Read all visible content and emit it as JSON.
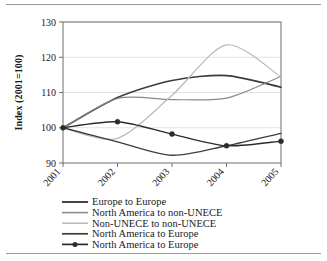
{
  "chart_data": {
    "type": "line",
    "title": "",
    "xlabel": "",
    "ylabel": "Index (2001=100)",
    "x": [
      "2001",
      "2002",
      "2003",
      "2004",
      "2005"
    ],
    "categories": [
      "2001",
      "2002",
      "2003",
      "2004",
      "2005"
    ],
    "ylim": [
      90,
      130
    ],
    "yticks": [
      90,
      100,
      110,
      120,
      130
    ],
    "grid": true,
    "legend_position": "bottom",
    "series": [
      {
        "name": "Europe to Europe",
        "color": "#3d3d3d",
        "marker": "none",
        "width": 1.6,
        "values": [
          100,
          108.6,
          113.4,
          114.8,
          111.5
        ]
      },
      {
        "name": "North America to non-UNECE",
        "color": "#888888",
        "marker": "none",
        "width": 1.2,
        "values": [
          100,
          108.3,
          108.0,
          108.4,
          114.6
        ]
      },
      {
        "name": "Non-UNECE to non-UNECE",
        "color": "#b8b8b8",
        "marker": "none",
        "width": 1.2,
        "values": [
          100,
          97.0,
          109.2,
          123.5,
          114.4
        ]
      },
      {
        "name": "North America to Europe",
        "color": "#3d3d3d",
        "marker": "none",
        "width": 1.4,
        "values": [
          100,
          96.0,
          92.2,
          94.9,
          98.4
        ]
      },
      {
        "name": "North America to Europe",
        "color": "#2b2b2b",
        "marker": "circle",
        "width": 1.4,
        "values": [
          100,
          101.7,
          98.2,
          94.9,
          96.2
        ]
      }
    ]
  },
  "axis": {
    "y_title": "Index (2001=100)",
    "y_tick_labels": [
      "130",
      "120",
      "110",
      "100",
      "90"
    ],
    "x_tick_labels": [
      "2001",
      "2002",
      "2003",
      "2004",
      "2005"
    ]
  },
  "legend": {
    "items": [
      {
        "label": "Europe to Europe"
      },
      {
        "label": "North America to non-UNECE"
      },
      {
        "label": "Non-UNECE to non-UNECE"
      },
      {
        "label": "North America to Europe"
      },
      {
        "label": "North America to Europe"
      }
    ]
  }
}
